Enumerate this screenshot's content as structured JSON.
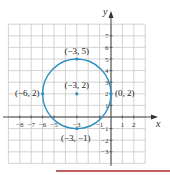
{
  "chart_data": {
    "type": "scatter",
    "title": "",
    "xlabel": "x",
    "ylabel": "y",
    "xlim": [
      -9,
      3
    ],
    "ylim": [
      -4,
      8
    ],
    "grid": true,
    "x_ticks": [
      "-8",
      "-7",
      "-6",
      "-5",
      "-3",
      "-1",
      "1",
      "2"
    ],
    "x_tick_values": [
      -8,
      -7,
      -6,
      -5,
      -3,
      -1,
      1,
      2
    ],
    "y_ticks": [
      "7",
      "6",
      "5",
      "4",
      "3",
      "2",
      "1",
      "-1",
      "-2",
      "-3"
    ],
    "y_tick_values": [
      7,
      6,
      5,
      4,
      3,
      2,
      1,
      -1,
      -2,
      -3
    ],
    "circle": {
      "center": [
        -3,
        2
      ],
      "radius": 3,
      "color": "#2a8fc0"
    },
    "points": [
      {
        "x": -3,
        "y": 5,
        "label": "(−3, 5)"
      },
      {
        "x": -3,
        "y": 2,
        "label": "(−3, 2)"
      },
      {
        "x": -6,
        "y": 2,
        "label": "(−6, 2)"
      },
      {
        "x": 0,
        "y": 2,
        "label": "(0, 2)"
      },
      {
        "x": -3,
        "y": -1,
        "label": "(−3, −1)"
      }
    ]
  }
}
